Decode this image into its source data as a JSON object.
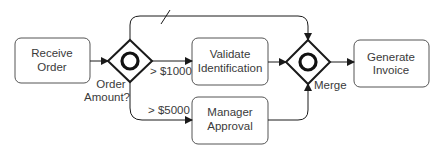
{
  "diagram": {
    "tasks": [
      {
        "id": "receive",
        "line1": "Receive",
        "line2": "Order"
      },
      {
        "id": "validate",
        "line1": "Validate",
        "line2": "Identification"
      },
      {
        "id": "manager",
        "line1": "Manager",
        "line2": "Approval"
      },
      {
        "id": "invoice",
        "line1": "Generate",
        "line2": "Invoice"
      }
    ],
    "gateways": [
      {
        "id": "split",
        "label1": "Order",
        "label2": "Amount?"
      },
      {
        "id": "merge",
        "label1": "Merge"
      }
    ],
    "flow_labels": {
      "gt1000": "> $1000",
      "gt5000": "> $5000"
    }
  }
}
